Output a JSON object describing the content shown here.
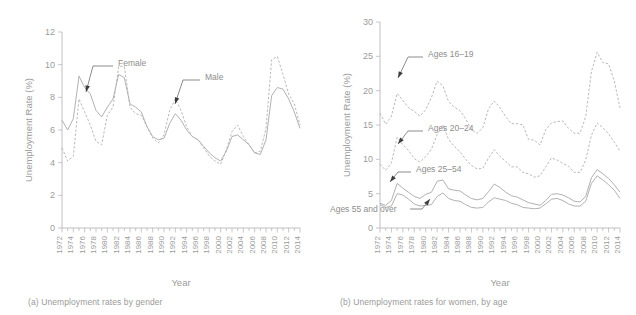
{
  "figure": {
    "panels": [
      {
        "id": "a",
        "caption": "(a) Unemployment rates by gender",
        "chart_data": {
          "type": "line",
          "title": "",
          "xlabel": "Year",
          "ylabel": "Unemployment Rate (%)",
          "xlim": [
            1972,
            2014
          ],
          "ylim": [
            0,
            12
          ],
          "ytick_labels": [
            "0",
            "2",
            "4",
            "6",
            "8",
            "10",
            "12"
          ],
          "yticks": [
            0,
            2,
            4,
            6,
            8,
            10,
            12
          ],
          "xtick_labels": [
            "1972",
            "1974",
            "1976",
            "1978",
            "1980",
            "1982",
            "1984",
            "1986",
            "1988",
            "1990",
            "1992",
            "1994",
            "1996",
            "1998",
            "2000",
            "2002",
            "2004",
            "2006",
            "2008",
            "2010",
            "2012",
            "2014"
          ],
          "xticks": [
            1972,
            1974,
            1976,
            1978,
            1980,
            1982,
            1984,
            1986,
            1988,
            1990,
            1992,
            1994,
            1996,
            1998,
            2000,
            2002,
            2004,
            2006,
            2008,
            2010,
            2012,
            2014
          ],
          "grid": false,
          "legend_position": "inline-annotation",
          "x": [
            1972,
            1973,
            1974,
            1975,
            1976,
            1977,
            1978,
            1979,
            1980,
            1981,
            1982,
            1983,
            1984,
            1985,
            1986,
            1987,
            1988,
            1989,
            1990,
            1991,
            1992,
            1993,
            1994,
            1995,
            1996,
            1997,
            1998,
            1999,
            2000,
            2001,
            2002,
            2003,
            2004,
            2005,
            2006,
            2007,
            2008,
            2009,
            2010,
            2011,
            2012,
            2013,
            2014
          ],
          "series": [
            {
              "name": "Female",
              "style": "solid",
              "values": [
                6.6,
                6.0,
                6.7,
                9.3,
                8.6,
                8.2,
                7.2,
                6.8,
                7.4,
                7.9,
                9.4,
                9.2,
                7.6,
                7.4,
                7.1,
                6.2,
                5.6,
                5.4,
                5.5,
                6.4,
                7.0,
                6.6,
                6.0,
                5.6,
                5.4,
                5.0,
                4.6,
                4.3,
                4.1,
                4.7,
                5.6,
                5.7,
                5.4,
                5.1,
                4.6,
                4.5,
                5.4,
                8.1,
                8.6,
                8.5,
                7.9,
                7.1,
                6.1
              ]
            },
            {
              "name": "Male",
              "style": "dashed",
              "values": [
                4.9,
                4.1,
                4.4,
                7.9,
                7.1,
                6.3,
                5.3,
                5.1,
                6.9,
                7.4,
                9.9,
                9.9,
                7.4,
                7.0,
                6.9,
                6.2,
                5.5,
                5.2,
                5.7,
                7.2,
                7.9,
                7.2,
                6.2,
                5.6,
                5.4,
                4.9,
                4.4,
                4.1,
                3.9,
                4.8,
                5.9,
                6.3,
                5.6,
                5.1,
                4.6,
                4.7,
                6.1,
                10.3,
                10.5,
                9.4,
                8.2,
                7.6,
                6.3
              ]
            }
          ],
          "annotations": [
            {
              "label": "Female",
              "target_year": 1975,
              "target_value": 9.3
            },
            {
              "label": "Male",
              "target_year": 1992,
              "target_value": 7.9
            }
          ]
        }
      },
      {
        "id": "b",
        "caption": "(b) Unemployment rates for women, by age",
        "chart_data": {
          "type": "line",
          "title": "",
          "xlabel": "Year",
          "ylabel": "Unemployment Rate (%)",
          "xlim": [
            1972,
            2014
          ],
          "ylim": [
            0,
            30
          ],
          "ytick_labels": [
            "0",
            "5",
            "10",
            "15",
            "20",
            "25",
            "30"
          ],
          "yticks": [
            0,
            5,
            10,
            15,
            20,
            25,
            30
          ],
          "xtick_labels": [
            "1972",
            "1974",
            "1976",
            "1978",
            "1980",
            "1982",
            "1984",
            "1986",
            "1988",
            "1990",
            "1992",
            "1994",
            "1996",
            "1998",
            "2000",
            "2002",
            "2004",
            "2006",
            "2008",
            "2010",
            "2012",
            "2014"
          ],
          "xticks": [
            1972,
            1974,
            1976,
            1978,
            1980,
            1982,
            1984,
            1986,
            1988,
            1990,
            1992,
            1994,
            1996,
            1998,
            2000,
            2002,
            2004,
            2006,
            2008,
            2010,
            2012,
            2014
          ],
          "grid": false,
          "legend_position": "inline-annotation",
          "x": [
            1972,
            1973,
            1974,
            1975,
            1976,
            1977,
            1978,
            1979,
            1980,
            1981,
            1982,
            1983,
            1984,
            1985,
            1986,
            1987,
            1988,
            1989,
            1990,
            1991,
            1992,
            1993,
            1994,
            1995,
            1996,
            1997,
            1998,
            1999,
            2000,
            2001,
            2002,
            2003,
            2004,
            2005,
            2006,
            2007,
            2008,
            2009,
            2010,
            2011,
            2012,
            2013,
            2014
          ],
          "series": [
            {
              "name": "Ages 16–19",
              "style": "dashed",
              "values": [
                16.7,
                15.1,
                16.3,
                19.6,
                18.6,
                17.5,
                17.0,
                16.3,
                17.2,
                19.0,
                21.4,
                20.7,
                18.4,
                17.6,
                17.1,
                15.9,
                14.3,
                13.8,
                14.6,
                17.4,
                18.5,
                17.5,
                16.2,
                15.2,
                15.2,
                15.0,
                12.9,
                12.8,
                12.1,
                14.3,
                15.3,
                15.5,
                15.6,
                14.5,
                13.8,
                13.8,
                16.2,
                22.8,
                25.6,
                24.1,
                23.9,
                21.4,
                17.5
              ]
            },
            {
              "name": "Ages 20–24",
              "style": "dashed",
              "values": [
                9.3,
                8.4,
                9.5,
                13.2,
                12.1,
                11.3,
                10.1,
                9.6,
                10.4,
                11.5,
                13.6,
                15.0,
                12.9,
                11.9,
                11.1,
                10.0,
                9.1,
                8.6,
                8.7,
                10.2,
                11.4,
                10.4,
                9.7,
                8.9,
                8.9,
                8.1,
                7.9,
                7.4,
                7.6,
                8.9,
                10.2,
                9.9,
                9.4,
                9.0,
                8.1,
                8.1,
                9.9,
                13.5,
                15.3,
                14.6,
                13.7,
                12.5,
                11.2
              ]
            },
            {
              "name": "Ages 25–54",
              "style": "solid",
              "values": [
                3.6,
                3.3,
                4.0,
                6.5,
                5.8,
                5.2,
                4.6,
                4.3,
                4.9,
                5.2,
                6.8,
                7.0,
                5.7,
                5.5,
                5.4,
                4.8,
                4.3,
                4.1,
                4.3,
                5.3,
                6.4,
                5.9,
                5.2,
                4.7,
                4.5,
                4.1,
                3.7,
                3.5,
                3.3,
                4.0,
                4.9,
                5.0,
                4.8,
                4.4,
                3.9,
                3.8,
                4.6,
                7.3,
                8.5,
                7.9,
                7.2,
                6.3,
                5.2
              ]
            },
            {
              "name": "Ages 55 and over",
              "style": "solid",
              "values": [
                3.4,
                3.0,
                3.2,
                5.0,
                4.8,
                4.2,
                3.5,
                3.2,
                3.3,
                3.4,
                4.6,
                5.1,
                4.3,
                4.0,
                3.9,
                3.4,
                3.0,
                2.9,
                3.0,
                3.8,
                4.4,
                4.2,
                4.0,
                3.6,
                3.4,
                3.0,
                2.9,
                2.8,
                2.9,
                3.5,
                4.2,
                4.3,
                4.0,
                3.5,
                3.2,
                3.2,
                3.9,
                6.5,
                7.6,
                7.0,
                6.3,
                5.5,
                4.3
              ]
            }
          ],
          "annotations": [
            {
              "label": "Ages 16–19",
              "target_year": 1984,
              "target_value": 19.6
            },
            {
              "label": "Ages 20–24",
              "target_year": 1984,
              "target_value": 11.5
            },
            {
              "label": "Ages 25–54",
              "target_year": 1985,
              "target_value": 5.6
            },
            {
              "label": "Ages 55 and over",
              "target_year": 1990,
              "target_value": 3.1
            }
          ]
        }
      }
    ]
  },
  "colors": {
    "background": "#ffffff",
    "axis": "#b9b9b9",
    "text": "#9c9c9c",
    "series_line": "#a8a8a8",
    "annotation": "#3d3d3d"
  }
}
